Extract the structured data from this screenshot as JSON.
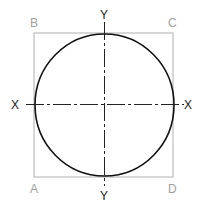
{
  "diagram": {
    "corners": {
      "a": "A",
      "b": "B",
      "c": "C",
      "d": "D"
    },
    "axes": {
      "x_left": "X",
      "x_right": "X",
      "y_top": "Y",
      "y_bottom": "Y"
    },
    "colors": {
      "square": "#b0b0b0",
      "circle": "#111111",
      "axis": "#222222",
      "corner_label": "#a0a0a0",
      "axis_label": "#222222"
    }
  }
}
